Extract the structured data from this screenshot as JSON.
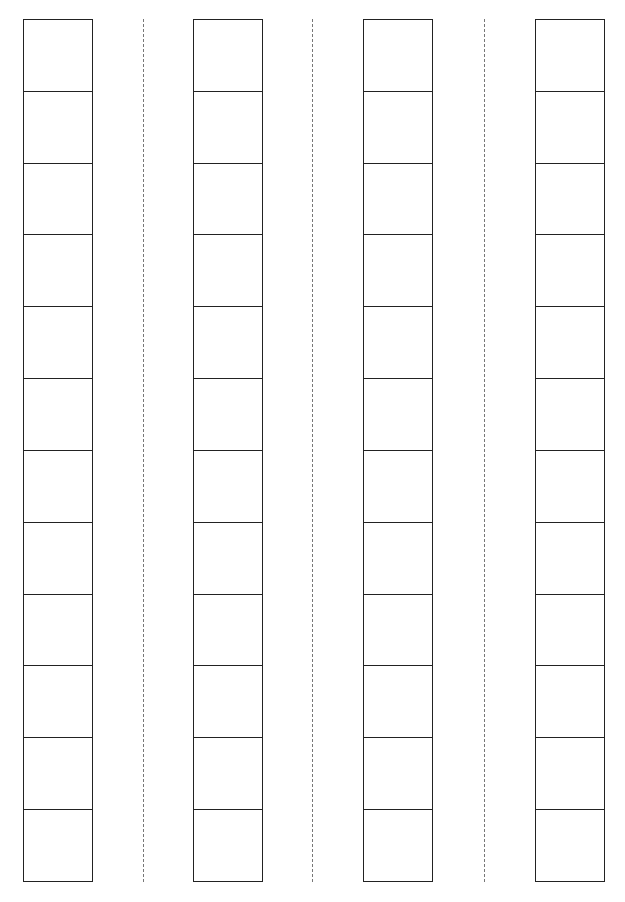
{
  "sheet": {
    "type": "blank strip worksheet",
    "background_color": "#ffffff",
    "line_color": "#222222",
    "cut_line_color": "#777777",
    "columns": [
      {
        "id": "column-1",
        "left": 23,
        "cell_count": 12
      },
      {
        "id": "column-2",
        "left": 193,
        "cell_count": 12
      },
      {
        "id": "column-3",
        "left": 363,
        "cell_count": 12
      },
      {
        "id": "column-4",
        "left": 535,
        "cell_count": 12
      }
    ],
    "cut_lines": [
      {
        "id": "cut-line-1",
        "x": 143
      },
      {
        "id": "cut-line-2",
        "x": 312
      },
      {
        "id": "cut-line-3",
        "x": 484
      }
    ],
    "cells_per_column": 12,
    "column_count": 4
  }
}
